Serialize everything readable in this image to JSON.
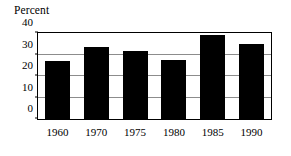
{
  "chart_data": {
    "type": "bar",
    "title": "Percent",
    "xlabel": "",
    "ylabel": "",
    "categories": [
      "1960",
      "1970",
      "1975",
      "1980",
      "1985",
      "1990"
    ],
    "values": [
      27,
      33.5,
      31.5,
      27.5,
      39,
      35
    ],
    "ylim": [
      0,
      40
    ],
    "yticks": [
      0,
      10,
      20,
      30,
      40
    ],
    "ytick_labels": [
      "0",
      "10",
      "20",
      "30",
      "40"
    ],
    "grid": true,
    "legend": null,
    "bar_color": "#000000",
    "grid_color": "#8c8c8c",
    "axis_color": "#000000",
    "background_color": "#ffffff"
  }
}
